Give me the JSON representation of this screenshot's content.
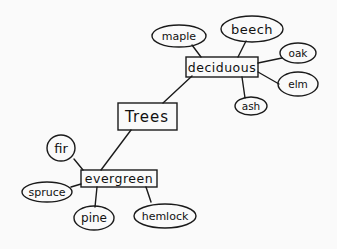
{
  "diagram": {
    "type": "concept-map",
    "root": {
      "id": "trees",
      "label": "Trees"
    },
    "categories": [
      {
        "id": "deciduous",
        "label": "deciduous",
        "children": [
          "maple",
          "beech",
          "oak",
          "elm",
          "ash"
        ]
      },
      {
        "id": "evergreen",
        "label": "evergreen",
        "children": [
          "fir",
          "spruce",
          "pine",
          "hemlock"
        ]
      }
    ],
    "nodes": {
      "trees": {
        "label": "Trees",
        "shape": "rect"
      },
      "deciduous": {
        "label": "deciduous",
        "shape": "rect"
      },
      "evergreen": {
        "label": "evergreen",
        "shape": "rect"
      },
      "maple": {
        "label": "maple",
        "shape": "ellipse"
      },
      "beech": {
        "label": "beech",
        "shape": "ellipse"
      },
      "oak": {
        "label": "oak",
        "shape": "ellipse"
      },
      "elm": {
        "label": "elm",
        "shape": "ellipse"
      },
      "ash": {
        "label": "ash",
        "shape": "ellipse"
      },
      "fir": {
        "label": "fir",
        "shape": "ellipse"
      },
      "spruce": {
        "label": "spruce",
        "shape": "ellipse"
      },
      "pine": {
        "label": "pine",
        "shape": "ellipse"
      },
      "hemlock": {
        "label": "hemlock",
        "shape": "ellipse"
      }
    },
    "edges": [
      [
        "trees",
        "deciduous"
      ],
      [
        "trees",
        "evergreen"
      ],
      [
        "deciduous",
        "maple"
      ],
      [
        "deciduous",
        "beech"
      ],
      [
        "deciduous",
        "oak"
      ],
      [
        "deciduous",
        "elm"
      ],
      [
        "deciduous",
        "ash"
      ],
      [
        "evergreen",
        "fir"
      ],
      [
        "evergreen",
        "spruce"
      ],
      [
        "evergreen",
        "pine"
      ],
      [
        "evergreen",
        "hemlock"
      ]
    ]
  }
}
